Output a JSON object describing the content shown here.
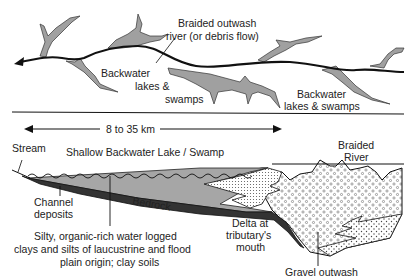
{
  "plan_view": {
    "labels": {
      "braided_line1": "Braided outwash",
      "braided_line2": "river (or debris flow)",
      "backwater_left_1": "Backwater",
      "backwater_left_2": "lakes &",
      "backwater_left_3": "swamps",
      "backwater_right_1": "Backwater",
      "backwater_right_2": "lakes & swamps"
    }
  },
  "section_view": {
    "scale_label": "8 to 35 km",
    "labels": {
      "stream": "Stream",
      "lake": "Shallow Backwater Lake / Swamp",
      "braided_1": "Braided",
      "braided_2": "River",
      "channel_1": "Channel",
      "channel_2": "deposits",
      "bedrock": "Bedrock",
      "delta_1": "Delta at",
      "delta_2": "tributary's",
      "delta_3": "mouth",
      "silty_1": "Silty, organic-rich water logged",
      "silty_2": "clays and silts of laucustrine and flood",
      "silty_3": "plain origin; clay soils",
      "gravel": "Gravel outwash"
    }
  },
  "colors": {
    "swamp_fill": "#a0a0a0",
    "clay_fill": "#a6a6a6",
    "bedrock_fill": "#333333",
    "line": "#111111"
  }
}
